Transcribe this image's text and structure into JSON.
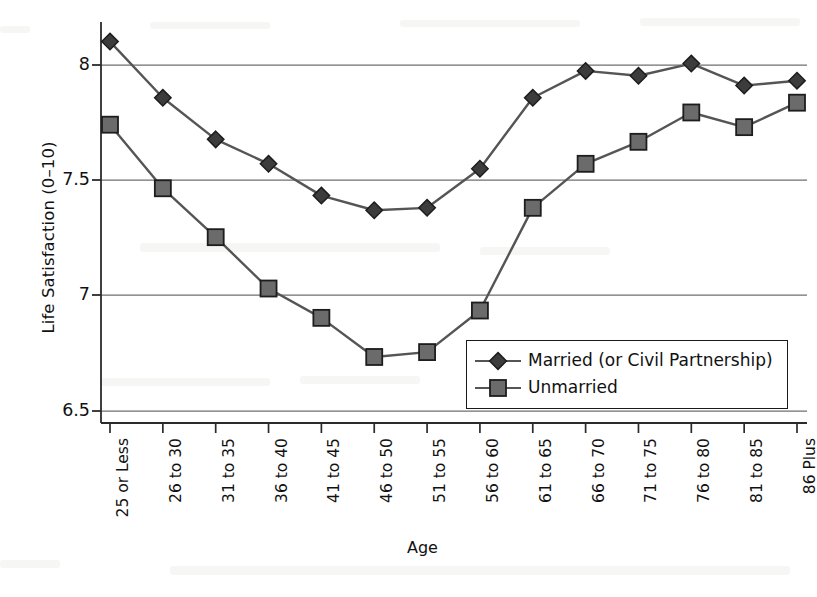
{
  "chart_data": {
    "type": "line",
    "title": "",
    "xlabel": "Age",
    "ylabel": "Life Satisfaction (0–10)",
    "categories": [
      "25 or Less",
      "26 to 30",
      "31 to 35",
      "36 to 40",
      "41 to 45",
      "46 to 50",
      "51 to 55",
      "56 to 60",
      "61 to 65",
      "66 to 70",
      "71 to 75",
      "76 to 80",
      "81 to 85",
      "86 Plus"
    ],
    "yticks": [
      "6.5",
      "7",
      "7.5",
      "8"
    ],
    "ytick_values": [
      6.5,
      7,
      7.5,
      8
    ],
    "ylim": [
      6.44,
      8.08
    ],
    "grid": "horizontal",
    "legend_position": "inside-lower-right",
    "series": [
      {
        "name": "Married (or Civil Partnership)",
        "marker": "diamond",
        "color": "#3c3c3c",
        "values": [
          8.0,
          7.77,
          7.6,
          7.5,
          7.37,
          7.31,
          7.32,
          7.48,
          7.77,
          7.88,
          7.86,
          7.91,
          7.82,
          7.84
        ]
      },
      {
        "name": "Unmarried",
        "marker": "square",
        "color": "#6b6b6b",
        "values": [
          7.66,
          7.4,
          7.2,
          6.99,
          6.87,
          6.71,
          6.73,
          6.9,
          7.32,
          7.5,
          7.59,
          7.71,
          7.65,
          7.75
        ]
      }
    ]
  },
  "legend": {
    "items": [
      {
        "label": "Married (or Civil Partnership)",
        "marker": "diamond"
      },
      {
        "label": "Unmarried",
        "marker": "square"
      }
    ]
  },
  "colors": {
    "married_marker": "#3c3c3c",
    "unmarried_marker": "#6b6b6b",
    "line": "#555555",
    "axis": "#333333",
    "grid": "#777777",
    "text": "#111111",
    "background": "#ffffff"
  }
}
